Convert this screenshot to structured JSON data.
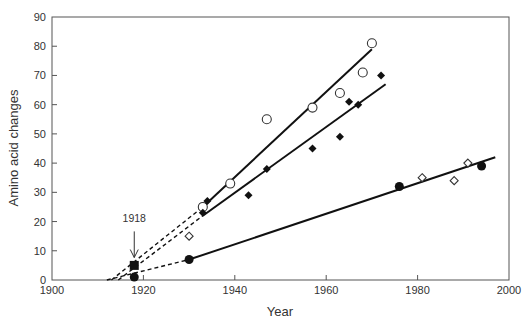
{
  "chart_data": {
    "type": "scatter",
    "title": "",
    "xlabel": "Year",
    "ylabel": "Amino acid changes",
    "xlim": [
      1900,
      2000
    ],
    "ylim": [
      0,
      90
    ],
    "xticks": [
      1900,
      1920,
      1940,
      1960,
      1980,
      2000
    ],
    "yticks": [
      0,
      10,
      20,
      30,
      40,
      50,
      60,
      70,
      80,
      90
    ],
    "grid": false,
    "legend": null,
    "annotations": [
      {
        "text": "1918",
        "x": 1918,
        "arrow_from": 18,
        "arrow_to": 7
      }
    ],
    "series": [
      {
        "name": "open-circles",
        "marker": "open-circle",
        "points": [
          [
            1933,
            25
          ],
          [
            1939,
            33
          ],
          [
            1947,
            55
          ],
          [
            1957,
            59
          ],
          [
            1963,
            64
          ],
          [
            1968,
            71
          ],
          [
            1970,
            81
          ]
        ],
        "fit": {
          "solid": [
            [
              1933,
              25
            ],
            [
              1970,
              79
            ]
          ],
          "dashed": [
            [
              1913,
              0
            ],
            [
              1933,
              25
            ]
          ]
        }
      },
      {
        "name": "filled-diamonds",
        "marker": "filled-diamond",
        "points": [
          [
            1933,
            23
          ],
          [
            1934,
            27
          ],
          [
            1943,
            29
          ],
          [
            1947,
            38
          ],
          [
            1957,
            45
          ],
          [
            1963,
            49
          ],
          [
            1965,
            61
          ],
          [
            1967,
            60
          ],
          [
            1972,
            70
          ]
        ],
        "fit": {
          "solid": [
            [
              1933,
              22
            ],
            [
              1973,
              67
            ]
          ],
          "dashed": [
            [
              1914.5,
              0
            ],
            [
              1933,
              22
            ]
          ]
        }
      },
      {
        "name": "filled-square",
        "marker": "filled-square",
        "points": [
          [
            1918,
            5
          ]
        ]
      },
      {
        "name": "filled-circles",
        "marker": "filled-circle",
        "points": [
          [
            1918,
            1
          ],
          [
            1930,
            7
          ],
          [
            1976,
            32
          ],
          [
            1994,
            39
          ]
        ],
        "fit": {
          "solid": [
            [
              1930,
              7
            ],
            [
              1997,
              42
            ]
          ],
          "dashed": [
            [
              1912,
              0
            ],
            [
              1930,
              7
            ]
          ]
        }
      },
      {
        "name": "open-diamonds",
        "marker": "open-diamond",
        "points": [
          [
            1930,
            15
          ],
          [
            1981,
            35
          ],
          [
            1988,
            34
          ],
          [
            1991,
            40
          ]
        ]
      }
    ]
  }
}
